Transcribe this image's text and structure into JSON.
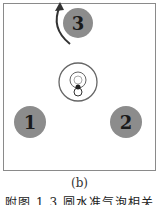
{
  "figure": {
    "subfigure_label": "(b)",
    "caption": "附图 1.3   圆水准气泡相关",
    "circles": [
      {
        "label": "3",
        "color": "#8c8c8c"
      },
      {
        "label": "1",
        "color": "#8c8c8c"
      },
      {
        "label": "2",
        "color": "#8c8c8c"
      }
    ],
    "arrow": "counterclockwise-rotation",
    "center": "bubble-level"
  }
}
